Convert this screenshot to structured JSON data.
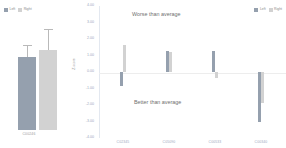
{
  "chart_data": {
    "type": "bar",
    "title": "",
    "xlabel": "",
    "ylabel": "Z-score",
    "ylim": [
      -4.0,
      4.0
    ],
    "grid": false,
    "zero_reference_line": true,
    "legend_position": "top-left and top-right",
    "y_ticks": [
      "4.00",
      "3.00",
      "2.00",
      "1.00",
      "0.00",
      "-1.00",
      "-2.00",
      "-3.00",
      "-4.00"
    ],
    "y_tick_values": [
      4.0,
      3.0,
      2.0,
      1.0,
      0.0,
      -1.0,
      -2.0,
      -3.0,
      -4.0
    ],
    "annotations": [
      {
        "text": "Worse than average",
        "region": "above-zero"
      },
      {
        "text": "Better than average",
        "region": "below-zero"
      }
    ],
    "categories": [
      "C02345",
      "C05090",
      "C00533",
      "C00340"
    ],
    "series": [
      {
        "name": "Left",
        "color": "#95a0ae",
        "values": [
          -0.85,
          1.3,
          1.25,
          -3.05
        ]
      },
      {
        "name": "Right",
        "color": "#d2d2d2",
        "values": [
          1.65,
          1.2,
          -0.35,
          -1.85
        ]
      }
    ],
    "inset_chart": {
      "type": "bar",
      "categories": [
        "C00246"
      ],
      "legend_position": "top-left",
      "series": [
        {
          "name": "Left",
          "color": "#95a0ae",
          "values": [
            3.25
          ],
          "error": [
            0.55
          ]
        },
        {
          "name": "Right",
          "color": "#d2d2d2",
          "values": [
            3.55
          ],
          "error": [
            0.95
          ]
        }
      ]
    }
  },
  "legend": {
    "left_label": "Left",
    "right_label": "Right"
  },
  "inset": {
    "category_label": "C00246"
  },
  "axis": {
    "y_label": "Z-score",
    "ticks": [
      "4.00",
      "3.00",
      "2.00",
      "1.00",
      "0.00",
      "-1.00",
      "-2.00",
      "-3.00",
      "-4.00"
    ]
  },
  "annotations": {
    "worse": "Worse than average",
    "better": "Better than average"
  },
  "categories": {
    "c1": "C02345",
    "c2": "C05090",
    "c3": "C00533",
    "c4": "C00340"
  }
}
